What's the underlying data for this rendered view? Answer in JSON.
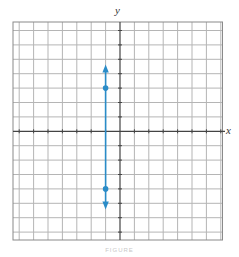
{
  "chart_data": {
    "type": "line",
    "title": "",
    "xlabel": "x",
    "ylabel": "y",
    "xlim": [
      -7.5,
      7.2
    ],
    "ylim": [
      -7.5,
      7.5
    ],
    "grid": true,
    "grid_step": 1,
    "series": [
      {
        "name": "vertical line x = -1",
        "color": "#2a8cc8",
        "x": [
          -1,
          -1
        ],
        "y": [
          -5.3,
          4.5
        ],
        "arrows": "both",
        "points": [
          {
            "x": -1,
            "y": 3
          },
          {
            "x": -1,
            "y": -4
          }
        ]
      }
    ],
    "caption": "FIGURE"
  },
  "labels": {
    "x": "x",
    "y": "y",
    "caption": "FIGURE"
  },
  "colors": {
    "line": "#2a8cc8",
    "grid": "#b5b5b5",
    "axis": "#444444"
  }
}
